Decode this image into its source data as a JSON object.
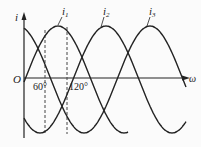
{
  "diagram": {
    "type": "three-phase sinusoidal waveform",
    "axes": {
      "y_label": "i",
      "x_label": "ω",
      "origin_label": "O"
    },
    "curves": [
      {
        "name": "i1",
        "label_main": "i",
        "label_sub": "1",
        "phase_deg": 0
      },
      {
        "name": "i2",
        "label_main": "i",
        "label_sub": "2",
        "phase_deg": -120
      },
      {
        "name": "i3",
        "label_main": "i",
        "label_sub": "3",
        "phase_deg": -240
      }
    ],
    "markers": [
      {
        "label": "60°",
        "angle_deg": 60
      },
      {
        "label": "120°",
        "angle_deg": 120
      }
    ],
    "colors": {
      "line": "#222222",
      "dashed": "#444444",
      "background": "#fbfbfb"
    }
  }
}
